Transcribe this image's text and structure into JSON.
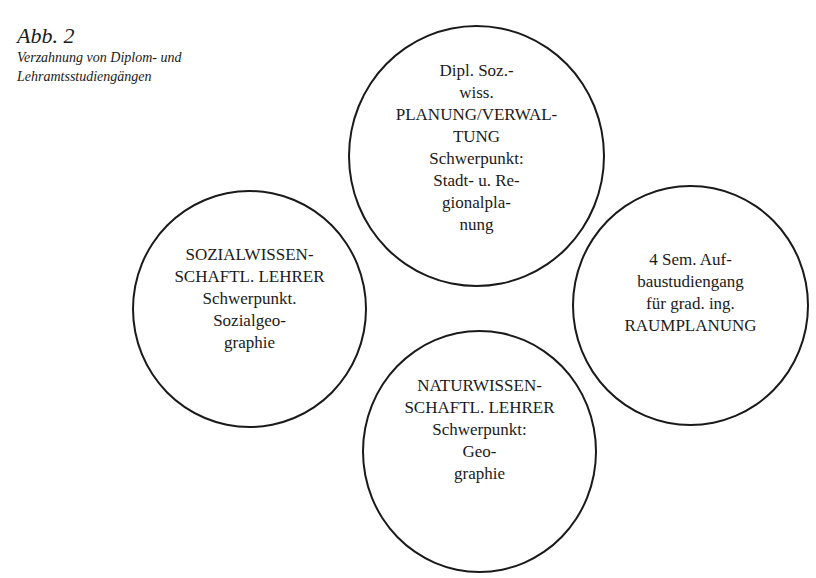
{
  "caption": {
    "figure_label": "Abb. 2",
    "title_lines": [
      "Verzahnung von Diplom- und",
      "Lehramtsstudiengängen"
    ]
  },
  "circles": {
    "top": {
      "lines": [
        "Dipl. Soz.-",
        "wiss.",
        "PLANUNG/VERWAL-",
        "TUNG",
        "Schwerpunkt:",
        "Stadt- u. Re-",
        "gionalpla-",
        "nung"
      ]
    },
    "left": {
      "lines": [
        "SOZIALWISSEN-",
        "SCHAFTL. LEHRER",
        "Schwerpunkt.",
        "Sozialgeo-",
        "graphie"
      ]
    },
    "right": {
      "lines": [
        "4 Sem. Auf-",
        "baustudiengang",
        "für grad. ing.",
        "RAUMPLANUNG"
      ]
    },
    "bottom": {
      "lines": [
        "NATURWISSEN-",
        "SCHAFTL. LEHRER",
        "Schwerpunkt:",
        "Geo-",
        "graphie"
      ]
    }
  },
  "colors": {
    "ink": "#1a1a1a",
    "paper": "#ffffff"
  }
}
